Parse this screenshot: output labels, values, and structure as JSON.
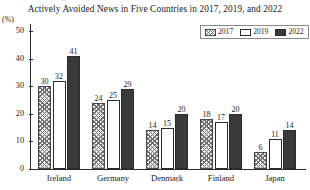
{
  "top_clipped_text": "Percentage of respondents",
  "chart_data": {
    "type": "bar",
    "title": "Actively Avoided News in Five Countries in 2017, 2019, and 2022",
    "xlabel": "",
    "ylabel": "(%)",
    "ylim": [
      0,
      50
    ],
    "yticks": [
      0,
      10,
      20,
      30,
      40,
      50
    ],
    "grid": false,
    "legend_position": "top-right",
    "categories": [
      "Ireland",
      "Germany",
      "Denmark",
      "Finland",
      "Japan"
    ],
    "series": [
      {
        "name": "2017",
        "values": [
          30,
          24,
          14,
          18,
          6
        ],
        "color": "#6e6e6e",
        "pattern": "crosshatch"
      },
      {
        "name": "2019",
        "values": [
          32,
          25,
          15,
          17,
          11
        ],
        "color": "#ffffff",
        "pattern": "outline"
      },
      {
        "name": "2022",
        "values": [
          41,
          29,
          20,
          20,
          14
        ],
        "color": "#3a3a3a",
        "pattern": "solid"
      }
    ]
  }
}
